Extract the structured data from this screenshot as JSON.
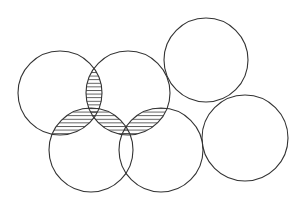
{
  "diagram": {
    "type": "overlapping-circles",
    "stroke_color": "#333333",
    "hatch_color": "#444444",
    "background": "#ffffff",
    "hatch_spacing": 3.6,
    "circles": [
      {
        "id": "c1",
        "cx": 60,
        "cy": 93,
        "r": 42
      },
      {
        "id": "c2",
        "cx": 128,
        "cy": 93,
        "r": 42
      },
      {
        "id": "c3",
        "cx": 206,
        "cy": 60,
        "r": 42
      },
      {
        "id": "c4",
        "cx": 91,
        "cy": 150,
        "r": 42
      },
      {
        "id": "c5",
        "cx": 161,
        "cy": 150,
        "r": 42
      },
      {
        "id": "c6",
        "cx": 245,
        "cy": 138,
        "r": 43
      }
    ],
    "hatched_intersections": [
      [
        "c1",
        "c2"
      ],
      [
        "c1",
        "c4"
      ],
      [
        "c2",
        "c4"
      ],
      [
        "c2",
        "c5"
      ]
    ]
  }
}
